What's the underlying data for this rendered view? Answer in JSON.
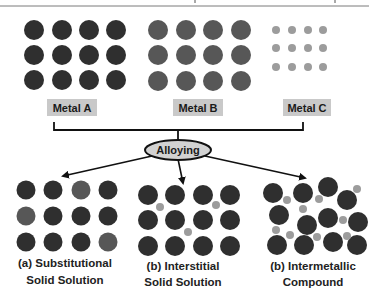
{
  "colors": {
    "dark_atom": "#2f2f2f",
    "metal_b_atom": "#575757",
    "small_atom": "#9c9c9c",
    "label_bg": "#c9c9c9",
    "ellipse_fill": "#d2d2d2",
    "line": "#111111"
  },
  "labels": {
    "metal_a": "Metal A",
    "metal_b": "Metal B",
    "metal_c": "Metal C",
    "process": "Alloying"
  },
  "captions": {
    "substitutional": {
      "line1": "(a) Substitutional",
      "line2": "Solid Solution"
    },
    "interstitial": {
      "line1": "(b) Interstitial",
      "line2": "Solid Solution"
    },
    "intermetallic": {
      "line1": "(b) Intermetallic",
      "line2": "Compound"
    }
  },
  "lattices": {
    "metal_a": {
      "cols": [
        34,
        62,
        89,
        116
      ],
      "rows": [
        30,
        55,
        80
      ],
      "r": 10,
      "color": "dark"
    },
    "metal_b": {
      "cols": [
        158,
        186,
        213,
        241
      ],
      "rows": [
        30,
        55,
        81
      ],
      "r": 10,
      "color": "metal_b"
    },
    "metal_c": {
      "cols": [
        276,
        292,
        308,
        323
      ],
      "rows": [
        30,
        48,
        67
      ],
      "r": 4,
      "color": "small"
    },
    "substitutional": {
      "cols": [
        26,
        53,
        81,
        108
      ],
      "rows": [
        190,
        216,
        242
      ],
      "r": 9.5,
      "pattern": [
        [
          "dark",
          "dark",
          "metal_b",
          "dark"
        ],
        [
          "metal_b",
          "dark",
          "dark",
          "dark"
        ],
        [
          "dark",
          "dark",
          "dark",
          "metal_b"
        ]
      ]
    },
    "interstitial": {
      "cols": [
        148,
        175,
        203,
        230
      ],
      "rows": [
        195,
        220,
        246
      ],
      "r": 10,
      "small": [
        [
          160,
          207
        ],
        [
          216,
          205
        ],
        [
          188,
          232
        ]
      ],
      "small_r": 4
    },
    "intermetallic": {
      "big": [
        [
          273,
          193
        ],
        [
          303,
          193
        ],
        [
          328,
          187
        ],
        [
          347,
          200
        ],
        [
          279,
          215
        ],
        [
          307,
          225
        ],
        [
          328,
          218
        ],
        [
          358,
          222
        ],
        [
          277,
          245
        ],
        [
          304,
          245
        ],
        [
          333,
          242
        ],
        [
          357,
          245
        ]
      ],
      "big_r": 10,
      "small": [
        [
          287,
          200
        ],
        [
          303,
          209
        ],
        [
          319,
          199
        ],
        [
          357,
          189
        ],
        [
          343,
          220
        ],
        [
          276,
          230
        ],
        [
          290,
          235
        ],
        [
          317,
          237
        ],
        [
          347,
          236
        ]
      ],
      "small_r": 4
    }
  }
}
